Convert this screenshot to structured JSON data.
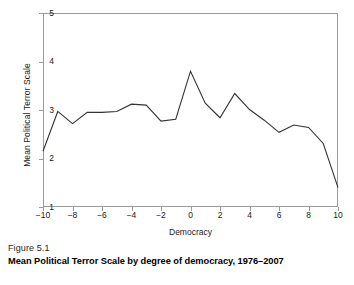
{
  "figure": {
    "caption_number": "Figure 5.1",
    "caption_title": "Mean Political Terror Scale by degree of democracy, 1976–2007"
  },
  "chart_data": {
    "type": "line",
    "title": "Mean Political Terror Scale by degree of democracy, 1976–2007",
    "xlabel": "Democracy",
    "ylabel": "Mean Political Terror Scale",
    "xlim": [
      -10,
      10
    ],
    "ylim": [
      1,
      5
    ],
    "grid": false,
    "legend": "none",
    "x_ticks": [
      "−10",
      "−8",
      "−6",
      "−4",
      "−2",
      "0",
      "2",
      "4",
      "6",
      "8",
      "10"
    ],
    "x_tick_values": [
      -10,
      -8,
      -6,
      -4,
      -2,
      0,
      2,
      4,
      6,
      8,
      10
    ],
    "y_ticks": [
      "1",
      "2",
      "3",
      "4",
      "5"
    ],
    "y_tick_values": [
      1,
      2,
      3,
      4,
      5
    ],
    "x": [
      -10,
      -9,
      -8,
      -7,
      -6,
      -5,
      -4,
      -3,
      -2,
      -1,
      0,
      1,
      2,
      3,
      4,
      5,
      6,
      7,
      8,
      9,
      10
    ],
    "values": [
      2.15,
      2.97,
      2.72,
      2.95,
      2.95,
      2.97,
      3.12,
      3.1,
      2.77,
      2.81,
      3.8,
      3.14,
      2.84,
      3.34,
      3.01,
      2.79,
      2.54,
      2.69,
      2.64,
      2.31,
      1.4
    ],
    "line_color": "#333333",
    "frame_color": "#9a9a9a"
  }
}
